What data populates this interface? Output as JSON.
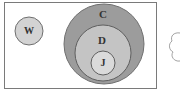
{
  "diagram": {
    "type": "venn-euler",
    "universe": {
      "label": ""
    },
    "sets": [
      {
        "id": "W",
        "label": "W",
        "color": "#d3d3d3"
      },
      {
        "id": "C",
        "label": "C",
        "color": "#9c9c9c"
      },
      {
        "id": "D",
        "label": "D",
        "color": "#c4c4c4",
        "subset_of": "C"
      },
      {
        "id": "J",
        "label": "J",
        "color": "#dadada",
        "subset_of": "D"
      }
    ],
    "colors": {
      "border": "#6f6f6f",
      "background": "#ffffff",
      "text": "#333333"
    }
  }
}
